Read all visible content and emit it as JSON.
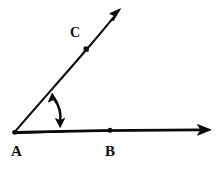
{
  "figure": {
    "kind": "hand-drawn-geometry-angle-diagram",
    "background_color": "#ffffff",
    "ink_color": "#0a0a0a",
    "width": 222,
    "height": 174,
    "labels": {
      "vertex": "A",
      "point_on_horizontal_ray": "B",
      "point_on_upper_ray": "C"
    },
    "points": {
      "A": {
        "label": "A",
        "x": 14,
        "y": 132,
        "label_x": 17,
        "label_y": 153,
        "has_dot": true
      },
      "B": {
        "label": "B",
        "x": 110,
        "y": 130,
        "label_x": 110,
        "label_y": 153,
        "has_dot": true
      },
      "C": {
        "label": "C",
        "x": 86,
        "y": 49,
        "label_x": 76,
        "label_y": 33,
        "has_dot": true
      }
    },
    "rays": [
      {
        "name": "ray-AB",
        "from": "A",
        "through": "B",
        "start_x": 14,
        "start_y": 132,
        "end_x": 211,
        "end_y": 130,
        "arrowhead": "end",
        "stroke_width": 2.6
      },
      {
        "name": "ray-AC",
        "from": "A",
        "through": "C",
        "start_x": 14,
        "start_y": 132,
        "end_x": 120,
        "end_y": 9,
        "arrowhead": "end",
        "stroke_width": 2.0
      }
    ],
    "angle_marker": {
      "name": "angle-double-arrow",
      "type": "curved-double-headed-arrow",
      "top_x": 53,
      "top_y": 94,
      "bottom_x": 60,
      "bottom_y": 127,
      "arrowheads": "both",
      "stroke_width": 2.4
    }
  }
}
